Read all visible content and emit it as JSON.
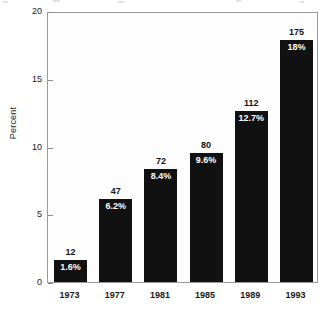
{
  "chart_data": {
    "type": "bar",
    "title": "",
    "subtitle": "",
    "xlabel": "",
    "ylabel": "Percent",
    "categories": [
      "1973",
      "1977",
      "1981",
      "1985",
      "1989",
      "1993"
    ],
    "values": [
      1.6,
      6.2,
      8.4,
      9.6,
      12.7,
      18
    ],
    "series": [
      {
        "name": "Percent",
        "values": [
          1.6,
          6.2,
          8.4,
          9.6,
          12.7,
          18
        ]
      }
    ],
    "bar_count_labels": [
      "12",
      "47",
      "72",
      "80",
      "112",
      "175"
    ],
    "bar_percent_labels": [
      "1.6%",
      "6.2%",
      "8.4%",
      "9.6%",
      "12.7%",
      "18%"
    ],
    "ylim": [
      0,
      20
    ],
    "yticks": [
      0,
      5,
      10,
      15,
      20
    ],
    "ytick_labels": [
      "0",
      "5",
      "10",
      "15",
      "20"
    ],
    "grid": false,
    "legend": false,
    "legend_position": "none",
    "bar_color": "#111111",
    "count_label_color": "#111111",
    "percent_label_color": "#ffffff",
    "plot_background": "#fdfdfd",
    "frame_color": "#9a9a9a"
  }
}
